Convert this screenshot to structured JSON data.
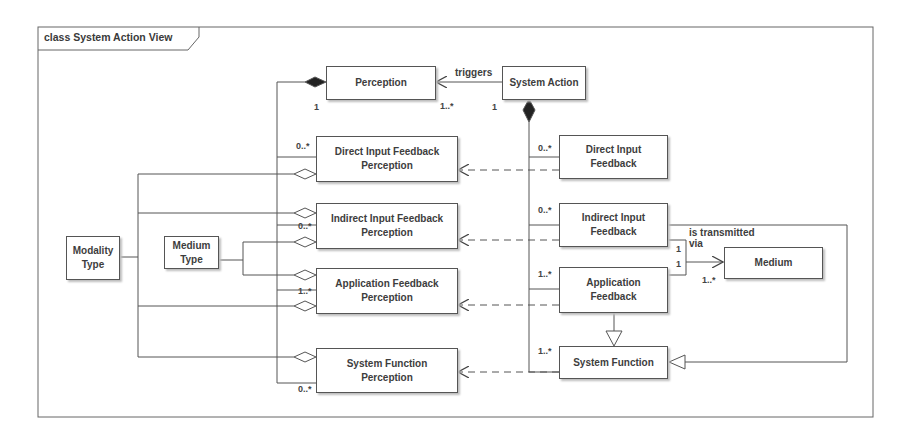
{
  "frame": {
    "title": "class System Action View"
  },
  "classes": {
    "perception": "Perception",
    "system_action": "System Action",
    "direct_input_feedback_perception": "Direct Input Feedback\nPerception",
    "indirect_input_feedback_perception": "Indirect Input Feedback\nPerception",
    "application_feedback_perception": "Application Feedback\nPerception",
    "system_function_perception": "System Function\nPerception",
    "direct_input_feedback": "Direct Input\nFeedback",
    "indirect_input_feedback": "Indirect Input\nFeedback",
    "application_feedback": "Application\nFeedback",
    "system_function": "System Function",
    "medium": "Medium",
    "modality_type": "Modality\nType",
    "medium_type": "Medium\nType"
  },
  "relations": {
    "triggers": "triggers",
    "is_transmitted_via": "is transmitted\nvia"
  },
  "multiplicities": {
    "perception_composite": "1",
    "triggers_target": "1..*",
    "triggers_source": "1",
    "difp": "0..*",
    "iifp": "0..*",
    "afp": "1..*",
    "sfp": "0..*",
    "dif": "0..*",
    "iif": "0..*",
    "af": "1..*",
    "sf": "1..*",
    "iif_medium": "1",
    "af_medium": "1",
    "medium": "1..*"
  }
}
